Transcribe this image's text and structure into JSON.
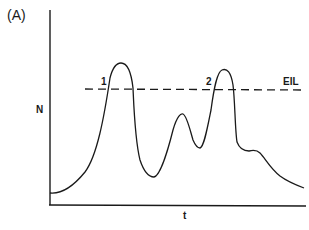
{
  "panel_label": "(A)",
  "axes": {
    "y_label": "N",
    "x_label": "t"
  },
  "threshold": {
    "label": "EIL",
    "style": "dashed"
  },
  "crossings": [
    {
      "label": "1"
    },
    {
      "label": "2"
    }
  ],
  "colors": {
    "line": "#1a1a1a",
    "background": "#ffffff"
  }
}
